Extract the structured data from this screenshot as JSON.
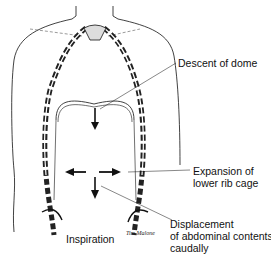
{
  "diagram": {
    "title": "Inspiration",
    "signature": "Tim Malone",
    "labels": {
      "descent": "Descent of dome",
      "expansion_line1": "Expansion of",
      "expansion_line2": "lower rib cage",
      "displacement_line1": "Displacement",
      "displacement_line2": "of abdominal contents",
      "displacement_line3": "caudally"
    },
    "colors": {
      "line": "#111111",
      "background": "#ffffff",
      "rib_shading": "#777777"
    }
  }
}
